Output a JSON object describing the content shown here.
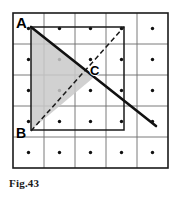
{
  "figure": {
    "caption": "Fig.43",
    "background_color": "#ffffff",
    "grid": {
      "rows": 5,
      "cols": 5,
      "origin_x": 13,
      "origin_y": 13,
      "cell_size": 31,
      "line_color": "#6b6b6b",
      "border_color": "#1a1a1a",
      "border_width": 1.6,
      "line_width": 0.9,
      "dot_color": "#111111",
      "dot_radius": 1.7,
      "dots_at_cell_centers": true
    },
    "inner_square": {
      "label": "inner-square",
      "x": 31,
      "y": 27,
      "width": 93,
      "height": 103,
      "stroke_color": "#1a1a1a",
      "stroke_width": 1.5,
      "fill": "none"
    },
    "shaded_triangle": {
      "label": "triangle-ABC",
      "vertices": "31,27 31,130 93,78",
      "fill_color": "#c9c9c9",
      "fill_opacity": 0.85,
      "stroke": "none"
    },
    "solid_line": {
      "label": "line-A-through-C",
      "x1": 31,
      "y1": 27,
      "x2": 156,
      "y2": 126,
      "stroke_color": "#111111",
      "stroke_width": 2.6,
      "style": "solid"
    },
    "dashed_line": {
      "label": "diagonal-B-to-top-right",
      "x1": 31,
      "y1": 131,
      "x2": 124,
      "y2": 27,
      "stroke_color": "#1a1a1a",
      "stroke_width": 1.5,
      "style": "dashed",
      "dash_pattern": "5,3"
    },
    "points": [
      {
        "name": "A",
        "label": "A",
        "x": 31,
        "y": 27
      },
      {
        "name": "B",
        "label": "B",
        "x": 31,
        "y": 130
      },
      {
        "name": "C",
        "label": "C",
        "x": 93,
        "y": 78
      }
    ]
  }
}
